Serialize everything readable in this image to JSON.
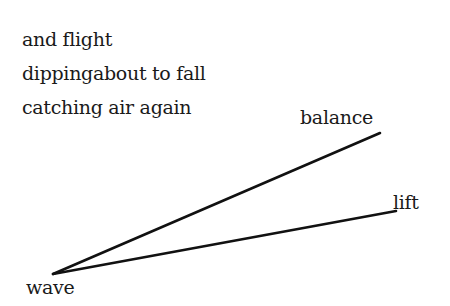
{
  "poem": {
    "lines": [
      "and flight",
      "dippingabout to fall",
      "catching air again"
    ]
  },
  "diagram": {
    "vertex": {
      "label": "wave",
      "x": 53,
      "y": 274
    },
    "rays": [
      {
        "label": "balance",
        "x2": 380,
        "y2": 133
      },
      {
        "label": "lift",
        "x2": 396,
        "y2": 211
      }
    ],
    "line_color": "#111111"
  }
}
